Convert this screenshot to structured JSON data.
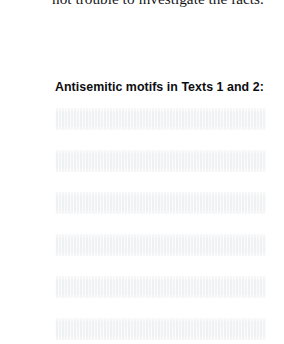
{
  "document": {
    "body_text": {
      "clipped_first_line": "",
      "line": "not trouble to investigate the facts."
    },
    "section": {
      "heading": "Antisemitic motifs in Texts 1 and 2:"
    },
    "placeholder_rows": [
      {
        "id": "row-1",
        "text": ""
      },
      {
        "id": "row-2",
        "text": ""
      },
      {
        "id": "row-3",
        "text": ""
      },
      {
        "id": "row-4",
        "text": ""
      },
      {
        "id": "row-5",
        "text": ""
      },
      {
        "id": "row-6",
        "text": ""
      }
    ],
    "colors": {
      "page_background": "#ffffff",
      "body_text": "#15161a",
      "heading_text": "#0c0d10",
      "placeholder_fill": "#f1f2f3"
    }
  }
}
